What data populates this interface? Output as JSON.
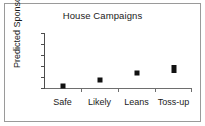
{
  "chart_data": {
    "type": "scatter",
    "title": "House Campaigns",
    "xlabel": "",
    "ylabel": "Predicted Sponsors",
    "categories": [
      "Safe",
      "Likely",
      "Leans",
      "Toss-up"
    ],
    "values": [
      0.4,
      1.5,
      2.8,
      3.4
    ],
    "series": [
      {
        "name": "Predicted Sponsors",
        "values": [
          0.4,
          1.5,
          2.8,
          3.4
        ]
      }
    ],
    "ylim": [
      0,
      10
    ],
    "yticks": [
      0,
      2,
      4,
      6,
      8,
      10
    ],
    "ytick_labels": [
      "0",
      "2",
      "4",
      "6",
      "8",
      "10"
    ],
    "grid": false,
    "legend": false,
    "marker": "square",
    "marker_color": "#111111",
    "axis_color": "#4d4d4d",
    "background_color": "#ffffff",
    "border_color": "#9a9a9a"
  }
}
